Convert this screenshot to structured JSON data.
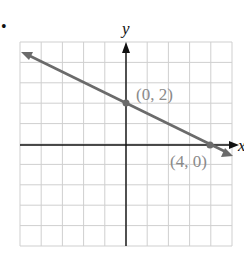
{
  "bullet": "•",
  "chart_data": {
    "type": "line",
    "title": "",
    "xlabel": "x",
    "ylabel": "y",
    "xlim": [
      -5,
      5
    ],
    "ylim": [
      -5,
      5
    ],
    "grid": true,
    "grid_step": 1,
    "series": [
      {
        "name": "line",
        "equation": "y = -x/2 + 2",
        "slope": -0.5,
        "intercept": 2,
        "x": [
          -5,
          0,
          4,
          5
        ],
        "y": [
          4.5,
          2,
          0,
          -0.5
        ],
        "arrows_both_ends": true,
        "color": "#6b6b6b"
      }
    ],
    "points": [
      {
        "label": "(0, 2)",
        "x": 0,
        "y": 2
      },
      {
        "label": "(4, 0)",
        "x": 4,
        "y": 0
      }
    ]
  },
  "labels": {
    "y_axis": "y",
    "x_axis": "x",
    "point_a": "(0, 2)",
    "point_b": "(4, 0)"
  },
  "colors": {
    "grid": "#cfcfcf",
    "axis": "#111111",
    "line": "#6b6b6b",
    "label": "#8a8a8a"
  }
}
